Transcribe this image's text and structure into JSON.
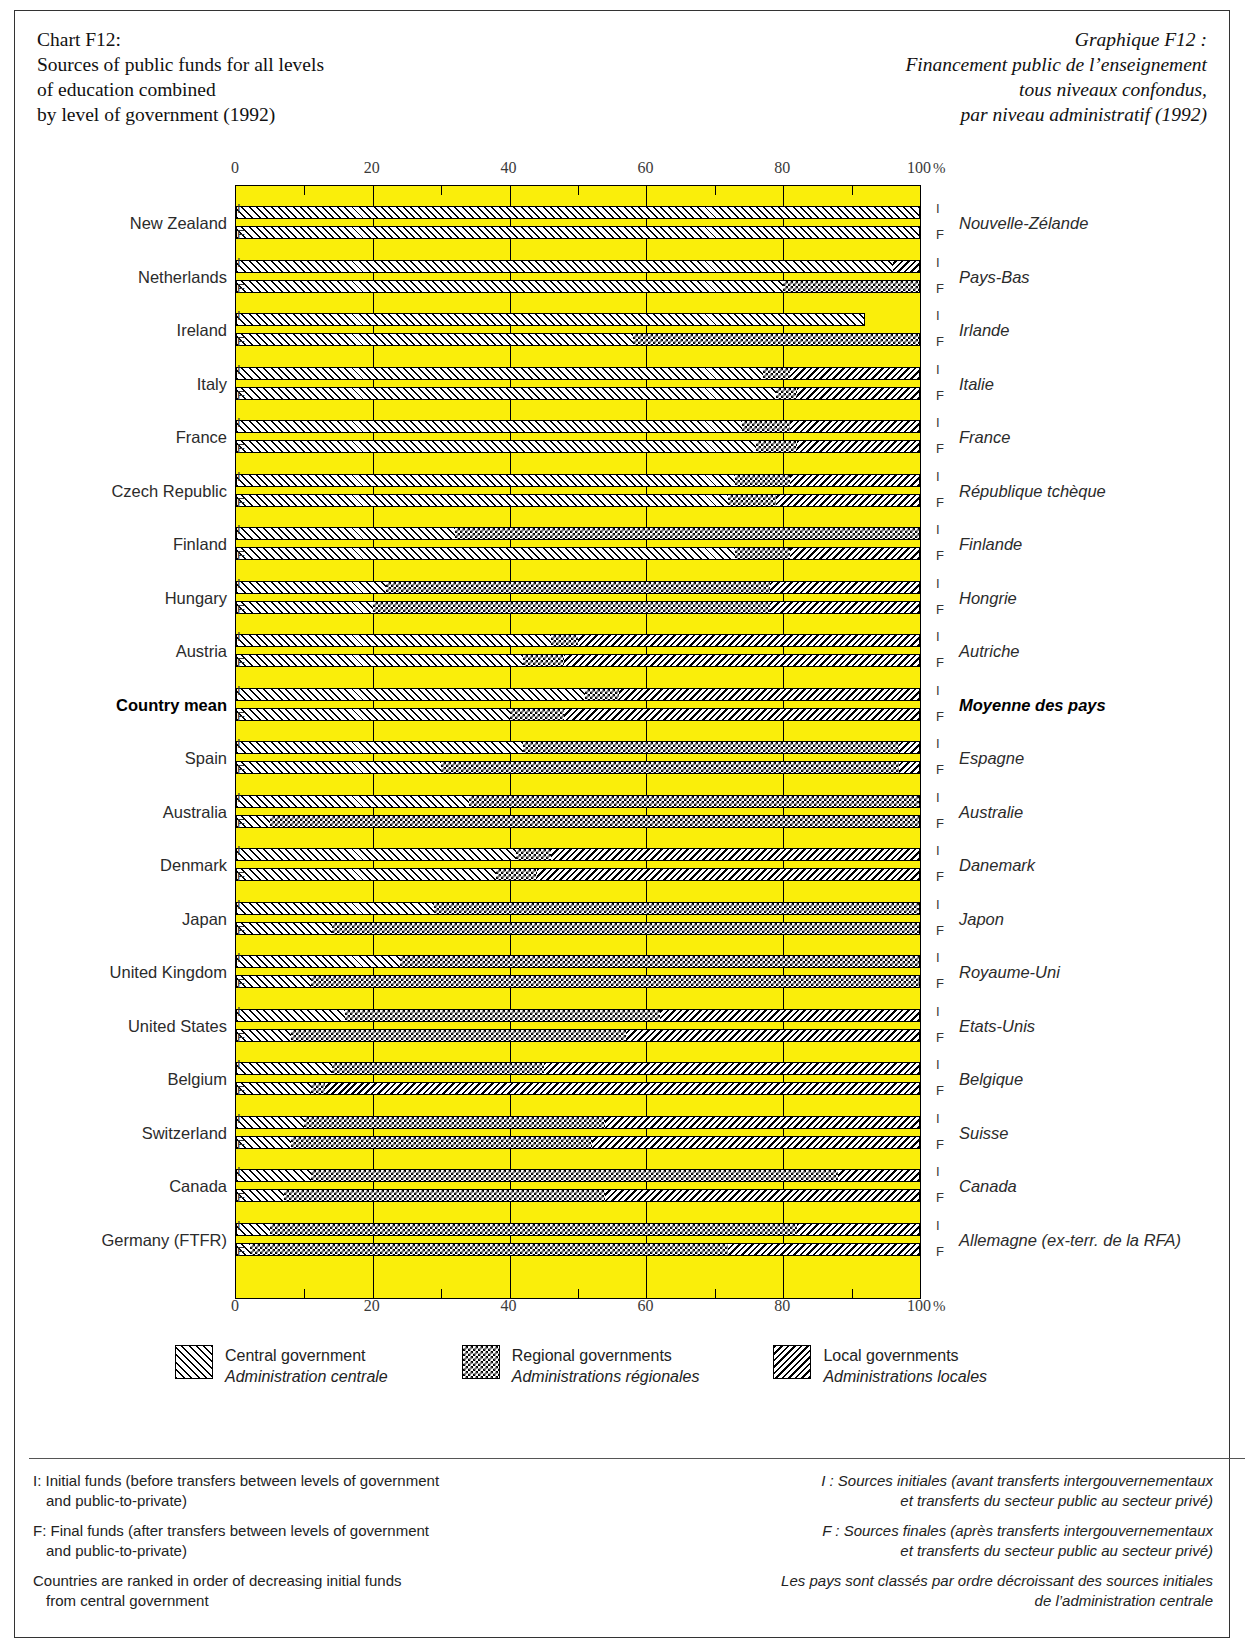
{
  "title": {
    "en": "Chart F12:\nSources of public funds for all levels\nof education combined\nby level of government (1992)",
    "fr": "Graphique F12 :\nFinancement public de l’enseignement\ntous niveaux confondus,\npar niveau administratif (1992)"
  },
  "axis": {
    "ticks": [
      "0",
      "20",
      "40",
      "60",
      "80",
      "100"
    ],
    "unit": "%"
  },
  "legend": [
    {
      "pattern": "central",
      "en": "Central government",
      "fr": "Administration centrale"
    },
    {
      "pattern": "regional",
      "en": "Regional governments",
      "fr": "Administrations régionales"
    },
    {
      "pattern": "local",
      "en": "Local governments",
      "fr": "Administrations locales"
    }
  ],
  "row_marks": {
    "initial": "I",
    "final": "F"
  },
  "footnotes": {
    "en": [
      {
        "line1": "I: Initial funds (before transfers between levels of government",
        "line2": "and public-to-private)"
      },
      {
        "line1": "F: Final funds (after transfers between levels of government",
        "line2": "and public-to-private)"
      },
      {
        "line1": "Countries are ranked in order of decreasing initial funds",
        "line2": "from central government"
      }
    ],
    "fr": [
      {
        "line1": "I : Sources initiales (avant transferts intergouvernementaux",
        "line2": "et transferts du secteur public au secteur privé)"
      },
      {
        "line1": "F : Sources finales (après transferts intergouvernementaux",
        "line2": "et transferts du secteur public au secteur privé)"
      },
      {
        "line1": "Les pays sont classés par ordre décroissant des sources initiales",
        "line2": "de l’administration centrale"
      }
    ]
  },
  "chart_data": {
    "type": "bar",
    "orientation": "horizontal",
    "stacked": true,
    "title": "Sources of public funds for all levels of education combined by level of government (1992)",
    "xlabel": "%",
    "ylabel": "",
    "xlim": [
      0,
      100
    ],
    "xticks": [
      0,
      20,
      40,
      60,
      80,
      100
    ],
    "minor_xticks": [
      10,
      30,
      50,
      70,
      90
    ],
    "grid": true,
    "legend_position": "bottom",
    "series": [
      {
        "name": "Central government",
        "name_fr": "Administration centrale",
        "pattern": "central"
      },
      {
        "name": "Regional governments",
        "name_fr": "Administrations régionales",
        "pattern": "regional"
      },
      {
        "name": "Local governments",
        "name_fr": "Administrations locales",
        "pattern": "local"
      }
    ],
    "categories": [
      {
        "en": "New Zealand",
        "fr": "Nouvelle-Zélande",
        "initial": {
          "central": 100.0,
          "regional": 0.0,
          "local": 0.0
        },
        "final": {
          "central": 100.0,
          "regional": 0.0,
          "local": 0.0
        }
      },
      {
        "en": "Netherlands",
        "fr": "Pays-Bas",
        "initial": {
          "central": 96.0,
          "regional": 0.0,
          "local": 4.0
        },
        "final": {
          "central": 80.0,
          "regional": 20.0,
          "local": 0.0
        }
      },
      {
        "en": "Ireland",
        "fr": "Irlande",
        "initial": {
          "central": 92.0,
          "regional": 0.0,
          "local": 0.0
        },
        "final": {
          "central": 58.0,
          "regional": 42.0,
          "local": 0.0
        }
      },
      {
        "en": "Italy",
        "fr": "Italie",
        "initial": {
          "central": 77.0,
          "regional": 4.0,
          "local": 19.0
        },
        "final": {
          "central": 79.0,
          "regional": 3.0,
          "local": 18.0
        }
      },
      {
        "en": "France",
        "fr": "France",
        "initial": {
          "central": 74.0,
          "regional": 7.0,
          "local": 19.0
        },
        "final": {
          "central": 76.0,
          "regional": 6.0,
          "local": 18.0
        }
      },
      {
        "en": "Czech Republic",
        "fr": "République tchèque",
        "initial": {
          "central": 73.0,
          "regional": 8.0,
          "local": 19.0
        },
        "final": {
          "central": 72.0,
          "regional": 7.0,
          "local": 21.0
        }
      },
      {
        "en": "Finland",
        "fr": "Finlande",
        "initial": {
          "central": 32.0,
          "regional": 68.0,
          "local": 0.0
        },
        "final": {
          "central": 73.0,
          "regional": 8.0,
          "local": 19.0
        }
      },
      {
        "en": "Hungary",
        "fr": "Hongrie",
        "initial": {
          "central": 22.0,
          "regional": 56.0,
          "local": 22.0
        },
        "final": {
          "central": 20.0,
          "regional": 58.0,
          "local": 22.0
        }
      },
      {
        "en": "Austria",
        "fr": "Autriche",
        "initial": {
          "central": 46.0,
          "regional": 4.0,
          "local": 50.0
        },
        "final": {
          "central": 42.0,
          "regional": 6.0,
          "local": 52.0
        }
      },
      {
        "en": "Country mean",
        "fr": "Moyenne des pays",
        "bold": true,
        "initial": {
          "central": 51.0,
          "regional": 5.0,
          "local": 44.0
        },
        "final": {
          "central": 40.0,
          "regional": 8.0,
          "local": 52.0
        }
      },
      {
        "en": "Spain",
        "fr": "Espagne",
        "initial": {
          "central": 42.0,
          "regional": 55.0,
          "local": 3.0
        },
        "final": {
          "central": 30.0,
          "regional": 67.0,
          "local": 3.0
        }
      },
      {
        "en": "Australia",
        "fr": "Australie",
        "initial": {
          "central": 34.0,
          "regional": 66.0,
          "local": 0.0
        },
        "final": {
          "central": 5.0,
          "regional": 95.0,
          "local": 0.0
        }
      },
      {
        "en": "Denmark",
        "fr": "Danemark",
        "initial": {
          "central": 41.0,
          "regional": 5.0,
          "local": 54.0
        },
        "final": {
          "central": 38.0,
          "regional": 6.0,
          "local": 56.0
        }
      },
      {
        "en": "Japan",
        "fr": "Japon",
        "initial": {
          "central": 29.0,
          "regional": 71.0,
          "local": 0.0
        },
        "final": {
          "central": 14.0,
          "regional": 86.0,
          "local": 0.0
        }
      },
      {
        "en": "United Kingdom",
        "fr": "Royaume-Uni",
        "initial": {
          "central": 24.0,
          "regional": 76.0,
          "local": 0.0
        },
        "final": {
          "central": 11.0,
          "regional": 89.0,
          "local": 0.0
        }
      },
      {
        "en": "United States",
        "fr": "Etats-Unis",
        "initial": {
          "central": 16.0,
          "regional": 46.0,
          "local": 38.0
        },
        "final": {
          "central": 8.0,
          "regional": 49.0,
          "local": 43.0
        }
      },
      {
        "en": "Belgium",
        "fr": "Belgique",
        "initial": {
          "central": 14.0,
          "regional": 31.0,
          "local": 55.0
        },
        "final": {
          "central": 11.0,
          "regional": 2.0,
          "local": 87.0
        }
      },
      {
        "en": "Switzerland",
        "fr": "Suisse",
        "initial": {
          "central": 10.0,
          "regional": 44.0,
          "local": 46.0
        },
        "final": {
          "central": 8.0,
          "regional": 44.0,
          "local": 48.0
        }
      },
      {
        "en": "Canada",
        "fr": "Canada",
        "initial": {
          "central": 11.0,
          "regional": 77.0,
          "local": 12.0
        },
        "final": {
          "central": 7.0,
          "regional": 47.0,
          "local": 46.0
        }
      },
      {
        "en": "Germany (FTFR)",
        "fr": "Allemagne (ex-terr. de la RFA)",
        "initial": {
          "central": 5.0,
          "regional": 77.0,
          "local": 18.0
        },
        "final": {
          "central": 2.0,
          "regional": 70.0,
          "local": 28.0
        }
      }
    ]
  }
}
